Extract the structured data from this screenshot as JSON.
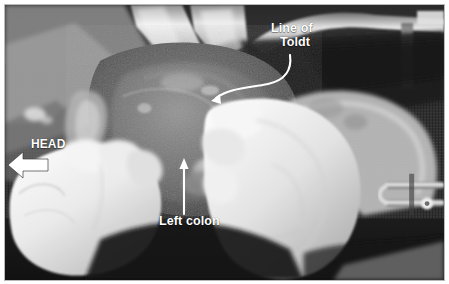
{
  "figure": {
    "domain": "medical-surgical-photograph",
    "modality": "intraoperative color photograph rendered in grayscale",
    "width": 449,
    "height": 284,
    "border_color": "#b9b9b9",
    "page_background": "#ffffff",
    "annotation_color": "#ffffff"
  },
  "annotations": {
    "line_of_toldt": {
      "line1": "Line of",
      "line2": "Toldt",
      "pointer": "curved-arrow",
      "pointer_target_x": 212,
      "pointer_target_y": 101
    },
    "left_colon": {
      "label": "Left colon",
      "pointer": "straight-arrow-up",
      "pointer_target_x": 184,
      "pointer_target_y": 160
    },
    "head": {
      "label": "HEAD",
      "pointer": "block-arrow-left",
      "pointer_direction": "left"
    }
  },
  "scene": {
    "description": "Open abdominal operative field with two gloved hands retracting tissue",
    "elements": [
      "metal-retractor-blade-top",
      "retractor-frame-bar-top-right",
      "surgical-drape-dark",
      "left-gloved-hand",
      "right-gloved-hand",
      "bowel-tissue",
      "surgical-clamp-right-edge"
    ]
  }
}
